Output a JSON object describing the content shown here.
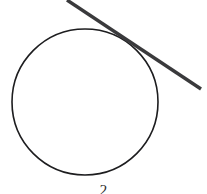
{
  "figure": {
    "caption": "2",
    "background_color": "#ffffff",
    "circle": {
      "name": "circle",
      "stroke_color": "#1d1d1f",
      "stroke_width": 1.6,
      "center_x": 85,
      "center_y": 102,
      "radius": 73,
      "fill": "none"
    },
    "tangent_line": {
      "name": "tangent-line",
      "stroke_color": "#3a3a3c",
      "stroke_width": 3.4,
      "x1": 67,
      "y1": 0,
      "x2": 201,
      "y2": 89
    },
    "tangent_point": {
      "x": 136,
      "y": 46
    }
  },
  "chart_data": {
    "type": "scatter",
    "title": "",
    "subtitle": "",
    "xlabel": "",
    "ylabel": "",
    "xlim": [
      0,
      207
    ],
    "ylim": [
      0,
      194
    ],
    "grid": false,
    "legend": "none",
    "annotations": [
      "2"
    ],
    "shapes": [
      {
        "kind": "circle",
        "label": "circle",
        "cx": 85,
        "cy": 102,
        "r": 73,
        "stroke": "#1d1d1f",
        "stroke_width": 1.6,
        "fill": "none"
      },
      {
        "kind": "line",
        "label": "tangent-line",
        "x": [
          67,
          201
        ],
        "y": [
          0,
          89
        ],
        "stroke": "#3a3a3c",
        "stroke_width": 3.4
      }
    ]
  }
}
